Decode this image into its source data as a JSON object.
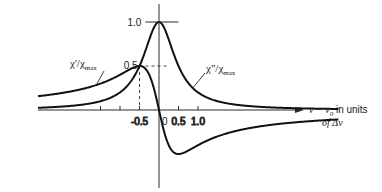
{
  "chart_data": {
    "type": "line",
    "title": "",
    "xlabel": "ν − ν0 in units of Δν",
    "xlabel_line1": "ν − ν",
    "xlabel_sub": "0",
    "xlabel_line1_rest": " in units",
    "xlabel_line2": "of Δν",
    "ylabel": "",
    "xlim": [
      -4,
      5.5
    ],
    "ylim": [
      -0.8,
      1.1
    ],
    "grid": false,
    "x_ticks": [
      -1.5,
      -1.0,
      -0.5,
      0.5,
      1.0
    ],
    "x_tick_labels": [
      "",
      "",
      "-0.5",
      "0.5",
      "1.0"
    ],
    "zero_label": "0",
    "y_annotations": [
      {
        "value": 1.0,
        "label": "1.0"
      },
      {
        "value": 0.5,
        "label": "0.5"
      }
    ],
    "series": [
      {
        "name": "χ''/χ''max",
        "label_main": "χ\"/χ",
        "label_sub": "max",
        "label_sup": "\"",
        "formula": "1/(1+4x^2)",
        "x": [
          -4,
          -3,
          -2,
          -1.5,
          -1,
          -0.75,
          -0.5,
          -0.25,
          0,
          0.25,
          0.5,
          0.75,
          1,
          1.5,
          2,
          3,
          4
        ],
        "values": [
          0.015,
          0.027,
          0.059,
          0.1,
          0.2,
          0.308,
          0.5,
          0.8,
          1.0,
          0.8,
          0.5,
          0.308,
          0.2,
          0.1,
          0.059,
          0.027,
          0.015
        ]
      },
      {
        "name": "χ'/χ''max",
        "label_main": "χ'/χ",
        "label_sub": "max",
        "label_sup": "\"",
        "formula": "-2x/(1+4x^2)",
        "x": [
          -4,
          -3,
          -2,
          -1.5,
          -1,
          -0.75,
          -0.5,
          -0.25,
          0,
          0.25,
          0.5,
          0.75,
          1,
          1.5,
          2,
          3,
          4
        ],
        "values": [
          0.123,
          0.162,
          0.235,
          0.3,
          0.4,
          0.462,
          0.5,
          0.4,
          0.0,
          -0.4,
          -0.5,
          -0.462,
          -0.4,
          -0.3,
          -0.235,
          -0.162,
          -0.123
        ]
      }
    ]
  }
}
